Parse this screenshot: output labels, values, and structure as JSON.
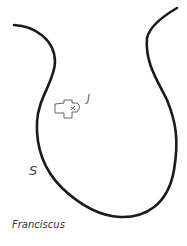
{
  "diagram": {
    "labels": {
      "s": "S",
      "j": "J",
      "name": "Franciscus"
    },
    "colors": {
      "outline": "#1a1a1a",
      "marker": "#555555",
      "text": "#4a4a4a"
    },
    "icons": {
      "marker": "cross-shaped-church-icon"
    }
  }
}
